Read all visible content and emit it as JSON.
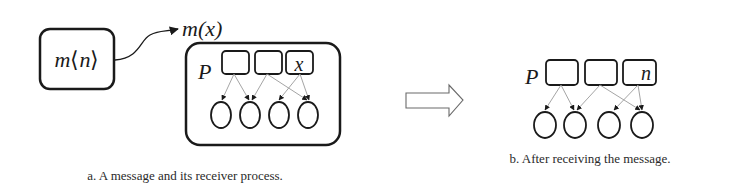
{
  "panel_a": {
    "message_label": "m⟨n⟩",
    "message_label_m": "m",
    "message_label_n": "n",
    "receiver_pattern_label": "m(x)",
    "process_label": "P",
    "slots": [
      "",
      "",
      "x"
    ],
    "circle_count": 4,
    "caption": "a.  A message and its receiver process."
  },
  "transition_arrow": "hollow-right-arrow",
  "panel_b": {
    "process_label": "P",
    "slots": [
      "",
      "",
      "n"
    ],
    "circle_count": 4,
    "caption": "b.  After receiving the message."
  },
  "colors": {
    "stroke": "#1a1a1a",
    "link": "#9a9a9a",
    "arrow_outline": "#6a6a6a"
  }
}
